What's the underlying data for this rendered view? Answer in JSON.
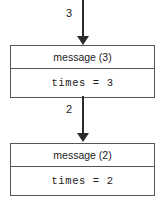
{
  "diagram": {
    "type": "linked-node-chain",
    "background_color": "#ffffff",
    "line_color": "#555555",
    "arrow_color": "#2b2b2b",
    "text_color": "#1c1c1c",
    "edges": [
      {
        "id": "edge-in",
        "label": "3",
        "direction": "down",
        "target": "node-1"
      },
      {
        "id": "edge-1-to-2",
        "label": "2",
        "direction": "down",
        "source": "node-1",
        "target": "node-2"
      }
    ],
    "nodes": [
      {
        "id": "node-1",
        "header": "message (3)",
        "body": "times = 3"
      },
      {
        "id": "node-2",
        "header": "message (2)",
        "body": "times = 2"
      }
    ]
  }
}
